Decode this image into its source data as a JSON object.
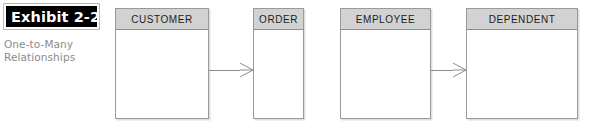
{
  "exhibit": {
    "label": "Exhibit 2-2",
    "caption_line_1": "One-to-Many",
    "caption_line_2": "Relationships"
  },
  "diagram": {
    "type": "entity-relationship-diagram",
    "notation": "crows-foot",
    "entities": [
      {
        "name": "CUSTOMER",
        "x": 115,
        "y": 8,
        "w": 94,
        "h": 111
      },
      {
        "name": "ORDER",
        "x": 253,
        "y": 8,
        "w": 51,
        "h": 111
      },
      {
        "name": "EMPLOYEE",
        "x": 340,
        "y": 8,
        "w": 91,
        "h": 111
      },
      {
        "name": "DEPENDENT",
        "x": 466,
        "y": 8,
        "w": 112,
        "h": 111
      }
    ],
    "relationships": [
      {
        "from": "CUSTOMER",
        "to": "ORDER",
        "cardinality": "one-to-many",
        "many_end": "ORDER"
      },
      {
        "from": "EMPLOYEE",
        "to": "DEPENDENT",
        "cardinality": "one-to-many",
        "many_end": "DEPENDENT"
      }
    ]
  },
  "colors": {
    "header_fill": "#d2d2d2",
    "box_border": "#9a9a9a",
    "body_fill": "#ffffff",
    "line": "#8d8d8d",
    "caption_text": "#8b8b8b",
    "label_bar": "#000000",
    "label_text": "#ffffff"
  }
}
